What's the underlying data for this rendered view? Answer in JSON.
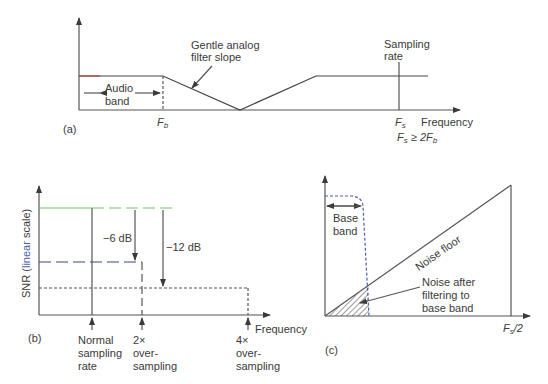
{
  "panel_a": {
    "tag": "(a)",
    "annotation_slope_1": "Gentle analog",
    "annotation_slope_2": "filter slope",
    "annotation_sampling_1": "Sampling",
    "annotation_sampling_2": "rate",
    "band_label_1": "Audio",
    "band_label_2": "band",
    "fb_label": "F",
    "fb_sub": "b",
    "fs_label": "F",
    "fs_sub": "s",
    "x_axis_label": "Frequency",
    "condition_f": "F",
    "condition_sub": "s",
    "condition_rest": " ≥ 2F",
    "condition_sub2": "b"
  },
  "panel_b": {
    "tag": "(b)",
    "y_axis_label_1": "SNR (",
    "y_axis_label_2": "linear",
    "y_axis_label_3": " scale)",
    "x_axis_label": "Frequency",
    "minus6": "−6 dB",
    "minus12": "−12 dB",
    "tick1_1": "Normal",
    "tick1_2": "sampling",
    "tick1_3": "rate",
    "tick2_1": "2×",
    "tick2_2": "over-",
    "tick2_3": "sampling",
    "tick3_1": "4×",
    "tick3_2": "over-",
    "tick3_3": "sampling"
  },
  "panel_c": {
    "tag": "(c)",
    "base_band_1": "Base",
    "base_band_2": "band",
    "noise_floor": "Noise floor",
    "noise_after_1": "Noise after",
    "noise_after_2": "filtering to",
    "noise_after_3": "base band",
    "x_end_f": "F",
    "x_end_sub": "s",
    "x_end_rest": "/2"
  },
  "colors": {
    "line": "#3a3a3a",
    "accent_green": "#6cc36c",
    "accent_blue": "#4a5fa8",
    "accent_red": "#c04040"
  }
}
